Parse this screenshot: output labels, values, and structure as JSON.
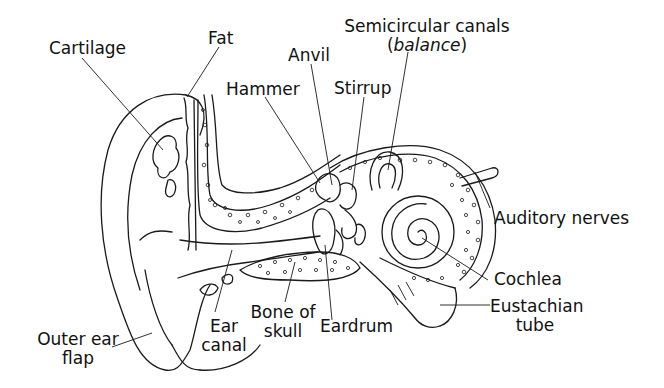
{
  "diagram": {
    "labels": [
      {
        "id": "cartilage",
        "text": "Cartilage"
      },
      {
        "id": "fat",
        "text": "Fat"
      },
      {
        "id": "anvil",
        "text": "Anvil"
      },
      {
        "id": "hammer",
        "text": "Hammer"
      },
      {
        "id": "stirrup",
        "text": "Stirrup"
      },
      {
        "id": "semicircular",
        "line1": "Semicircular canals",
        "line2_open": "(",
        "line2_italic": "balance",
        "line2_close": ")"
      },
      {
        "id": "auditory",
        "text": "Auditory nerves"
      },
      {
        "id": "cochlea",
        "text": "Cochlea"
      },
      {
        "id": "eustachian",
        "line1": "Eustachian",
        "line2": "tube"
      },
      {
        "id": "eardrum",
        "text": "Eardrum"
      },
      {
        "id": "bone",
        "line1": "Bone of",
        "line2": "skull"
      },
      {
        "id": "earcanal",
        "line1": "Ear",
        "line2": "canal"
      },
      {
        "id": "outer",
        "line1": "Outer ear",
        "line2": "flap"
      }
    ],
    "colors": {
      "ink": "#1a1a1a",
      "background": "#ffffff"
    }
  }
}
